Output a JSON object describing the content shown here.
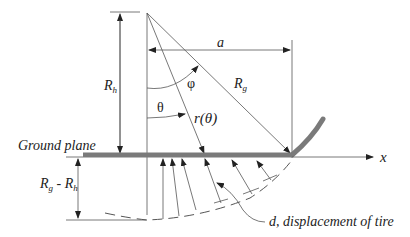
{
  "diagram": {
    "labels": {
      "ground_plane": "Ground plane",
      "x_axis": "x",
      "a": "a",
      "phi": "φ",
      "theta": "θ",
      "r_theta": "r(θ)",
      "Rg": "R",
      "Rg_sub": "g",
      "Rh": "R",
      "Rh_sub": "h",
      "Rg_minus_Rh_a": "R",
      "Rg_minus_Rh_a_sub": "g",
      "Rg_minus_Rh_minus": " - ",
      "Rg_minus_Rh_b": "R",
      "Rg_minus_Rh_b_sub": "h",
      "displacement": "d, displacement of tire"
    },
    "colors": {
      "line": "#555555",
      "ground": "#7a7a7a",
      "text": "#222222"
    }
  }
}
